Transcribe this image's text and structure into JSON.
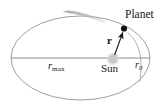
{
  "figure": {
    "width": 167,
    "height": 112,
    "background_color": "#ffffff"
  },
  "labels": {
    "planet": "Planet",
    "sun": "Sun",
    "r_vector": "r",
    "r_max_base": "r",
    "r_max_sub": "max",
    "r_zero_base": "r",
    "r_zero_sub": "0"
  },
  "colors": {
    "orbit_stroke": "#8d8d8d",
    "axis_stroke": "#8a8a8a",
    "direction_arrow": "#b9b9b9",
    "planet_dot": "#111111",
    "sun_body": "#c9c9c9",
    "sun_glow": "#dedede",
    "r_arrow": "#1a1a1a",
    "perihelion_arc": "#9a9a9a",
    "text": "#161616"
  },
  "geometry": {
    "ellipse": {
      "cx": 80.5,
      "cy": 58,
      "rx": 69.5,
      "ry": 42
    },
    "major_axis": {
      "x1": 11,
      "y1": 58,
      "x2": 150,
      "y2": 58
    },
    "sun": {
      "cx": 113,
      "cy": 59,
      "r": 5.2
    },
    "planet": {
      "cx": 124,
      "cy": 28.5,
      "r": 3.2
    },
    "r_arrow": {
      "x1": 114.5,
      "y1": 55.5,
      "x2": 122.6,
      "y2": 31.5
    },
    "direction_arrow": {
      "tip_x": 63,
      "tip_y": 11.5,
      "tail_x": 106,
      "tail_y": 20
    },
    "perihelion_arc": {
      "start_x": 128,
      "start_y": 33,
      "end_x": 141,
      "end_y": 80
    }
  },
  "icons": {
    "planet_marker": "filled-dot",
    "sun_marker": "soft-disc",
    "orbit_direction": "tapered-arrow",
    "radius_vector": "arrow"
  }
}
